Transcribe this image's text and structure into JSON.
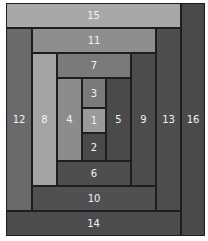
{
  "diagram": {
    "blocks": [
      {
        "label": "15",
        "x": 6,
        "y": 3,
        "w": 175,
        "h": 25,
        "color": "#a8a8a8"
      },
      {
        "label": "16",
        "x": 181,
        "y": 3,
        "w": 24,
        "h": 233,
        "color": "#4a4a4a"
      },
      {
        "label": "12",
        "x": 6,
        "y": 28,
        "w": 26,
        "h": 183,
        "color": "#6a6a6a"
      },
      {
        "label": "14",
        "x": 6,
        "y": 211,
        "w": 175,
        "h": 25,
        "color": "#4c4c4c"
      },
      {
        "label": "11",
        "x": 32,
        "y": 28,
        "w": 124,
        "h": 25,
        "color": "#8e8e8e"
      },
      {
        "label": "13",
        "x": 156,
        "y": 28,
        "w": 25,
        "h": 183,
        "color": "#4e4e4e"
      },
      {
        "label": "8",
        "x": 32,
        "y": 53,
        "w": 25,
        "h": 133,
        "color": "#a4a4a4"
      },
      {
        "label": "10",
        "x": 32,
        "y": 186,
        "w": 124,
        "h": 25,
        "color": "#505050"
      },
      {
        "label": "7",
        "x": 57,
        "y": 53,
        "w": 74,
        "h": 25,
        "color": "#7a7a7a"
      },
      {
        "label": "9",
        "x": 131,
        "y": 53,
        "w": 25,
        "h": 133,
        "color": "#4c4c4c"
      },
      {
        "label": "4",
        "x": 57,
        "y": 78,
        "w": 25,
        "h": 83,
        "color": "#8c8c8c"
      },
      {
        "label": "6",
        "x": 57,
        "y": 161,
        "w": 74,
        "h": 25,
        "color": "#4e4e4e"
      },
      {
        "label": "3",
        "x": 82,
        "y": 78,
        "w": 24,
        "h": 30,
        "color": "#7a7a7a"
      },
      {
        "label": "1",
        "x": 82,
        "y": 108,
        "w": 24,
        "h": 25,
        "color": "#9a9a9a"
      },
      {
        "label": "2",
        "x": 82,
        "y": 133,
        "w": 24,
        "h": 28,
        "color": "#4a4a4a"
      },
      {
        "label": "5",
        "x": 106,
        "y": 78,
        "w": 25,
        "h": 83,
        "color": "#4a4a4a"
      }
    ]
  }
}
